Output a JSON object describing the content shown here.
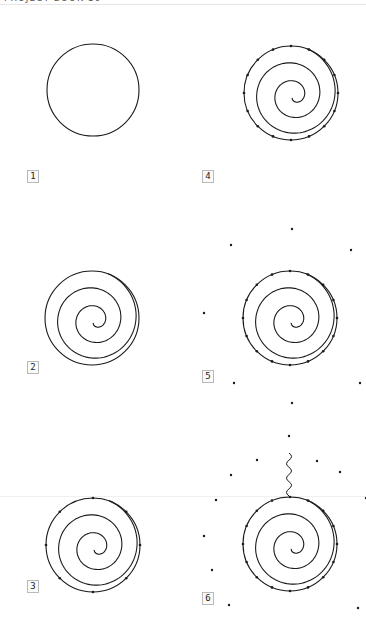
{
  "page": {
    "header_text_cut": "PROJECT BOOK 10",
    "background": "#ffffff",
    "stroke_color": "#1a1a1a"
  },
  "panels": [
    {
      "step": "1",
      "cx": 93,
      "cy": 90,
      "r": 46,
      "spiral": false,
      "ticks": 0,
      "label": {
        "x": 27,
        "y": 170
      }
    },
    {
      "step": "2",
      "cx": 92,
      "cy": 318,
      "r": 47,
      "spiral": true,
      "ticks": 0,
      "label": {
        "x": 27,
        "y": 361
      }
    },
    {
      "step": "3",
      "cx": 93,
      "cy": 545,
      "r": 47,
      "spiral": true,
      "ticks": 8,
      "label": {
        "x": 27,
        "y": 580
      }
    },
    {
      "step": "4",
      "cx": 291,
      "cy": 93,
      "r": 47,
      "spiral": true,
      "ticks": 16,
      "label": {
        "x": 202,
        "y": 170
      }
    },
    {
      "step": "5",
      "cx": 290,
      "cy": 318,
      "r": 47,
      "spiral": true,
      "ticks": 16,
      "label": {
        "x": 202,
        "y": 370
      }
    },
    {
      "step": "6",
      "cx": 290,
      "cy": 544,
      "r": 47,
      "spiral": true,
      "ticks": 16,
      "label": {
        "x": 202,
        "y": 592
      }
    }
  ],
  "outer_dots": [
    [
      231,
      245
    ],
    [
      292,
      229
    ],
    [
      351,
      250
    ],
    [
      204,
      313
    ],
    [
      234,
      383
    ],
    [
      360,
      383
    ],
    [
      292,
      403
    ],
    [
      289,
      436
    ],
    [
      257,
      460
    ],
    [
      317,
      461
    ],
    [
      231,
      475
    ],
    [
      340,
      472
    ],
    [
      216,
      500
    ],
    [
      366,
      498
    ],
    [
      204,
      536
    ],
    [
      212,
      570
    ],
    [
      229,
      605
    ],
    [
      358,
      608
    ]
  ],
  "wavy_stem": {
    "x": 289,
    "y_top": 453,
    "y_bottom": 496
  }
}
